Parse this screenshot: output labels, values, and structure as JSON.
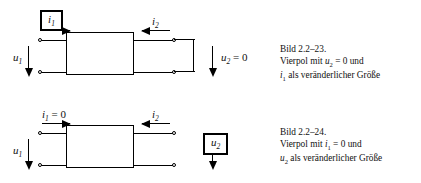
{
  "figure": {
    "ink_color": "#000000",
    "background_color": "#ffffff"
  },
  "circuits": [
    {
      "id": "bild-2-2-23",
      "position": "top",
      "output_condition": "short-circuit",
      "highlighted_quantity": "i1",
      "labels": {
        "input_current": {
          "symbol": "i",
          "sub": "1",
          "suffix": "",
          "boxed": true
        },
        "output_current": {
          "symbol": "i",
          "sub": "2",
          "suffix": "",
          "boxed": false
        },
        "input_voltage": {
          "symbol": "u",
          "sub": "1",
          "suffix": "",
          "boxed": false
        },
        "output_voltage": {
          "symbol": "u",
          "sub": "2",
          "suffix": " = 0",
          "boxed": false
        }
      },
      "caption": {
        "line1": "Bild 2.2–23.",
        "line2_pre": "Vierpol mit ",
        "line2_sym": "u",
        "line2_sub": "2",
        "line2_post": " = 0 und",
        "line3_sym": "i",
        "line3_sub": "1",
        "line3_post": " als veränderlicher Größe"
      }
    },
    {
      "id": "bild-2-2-24",
      "position": "bottom",
      "output_condition": "open-circuit",
      "highlighted_quantity": "u2",
      "labels": {
        "input_current": {
          "symbol": "i",
          "sub": "1",
          "suffix": " = 0",
          "boxed": false
        },
        "output_current": {
          "symbol": "i",
          "sub": "2",
          "suffix": "",
          "boxed": false
        },
        "input_voltage": {
          "symbol": "u",
          "sub": "1",
          "suffix": "",
          "boxed": false
        },
        "output_voltage": {
          "symbol": "u",
          "sub": "2",
          "suffix": "",
          "boxed": true
        }
      },
      "caption": {
        "line1": "Bild 2.2–24.",
        "line2_pre": "Vierpol mit ",
        "line2_sym": "i",
        "line2_sub": "1",
        "line2_post": " = 0 und",
        "line3_sym": "u",
        "line3_sub": "2",
        "line3_post": " als veränderlicher Größe"
      }
    }
  ]
}
